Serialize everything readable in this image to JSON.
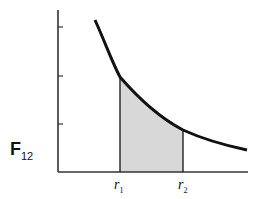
{
  "diagram": {
    "ylabel_main": "F",
    "ylabel_sub": "12",
    "xlabels": [
      {
        "main": "r",
        "sub": "1"
      },
      {
        "main": "r",
        "sub": "2"
      }
    ],
    "colors": {
      "curve": "#111111",
      "shade": "#d8d8d8",
      "axis": "#333333"
    }
  }
}
